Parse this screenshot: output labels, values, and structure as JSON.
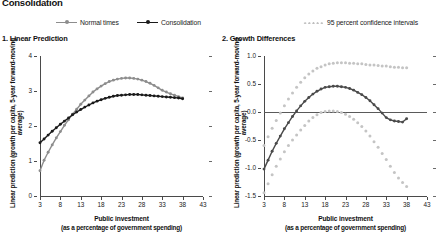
{
  "figure": {
    "title": "Consolidation"
  },
  "legend": {
    "items": [
      {
        "label": "Normal times",
        "style": "line-marker",
        "color": "#8d8d8d"
      },
      {
        "label": "Consolidation",
        "style": "line-marker",
        "color": "#1a1a1a"
      },
      {
        "label": "95 percent confidence intervals",
        "style": "dotted",
        "color": "#bdbdbd"
      }
    ]
  },
  "chart_data": [
    {
      "type": "line",
      "panel_id": 1,
      "title": "1. Linear Prediction",
      "xlabel": "Public investment",
      "xlabel_sub": "(as a percentage of government spending)",
      "ylabel": "Linear prediction (growth per capita, 5-year forward-moving average)",
      "xlim": [
        3,
        43
      ],
      "ylim": [
        0,
        4
      ],
      "xticks": [
        3,
        8,
        13,
        18,
        23,
        28,
        33,
        38,
        43
      ],
      "yticks": [
        0,
        1,
        2,
        3,
        4
      ],
      "grid": false,
      "legend_position": "top",
      "series": [
        {
          "name": "Normal times",
          "color": "#8d8d8d",
          "x": [
            3,
            4,
            5,
            6,
            7,
            8,
            9,
            10,
            11,
            12,
            13,
            14,
            15,
            16,
            17,
            18,
            19,
            20,
            21,
            22,
            23,
            24,
            25,
            26,
            27,
            28,
            29,
            30,
            31,
            32,
            33,
            34,
            35,
            36,
            37,
            38
          ],
          "values": [
            0.72,
            1.02,
            1.25,
            1.46,
            1.66,
            1.84,
            2.02,
            2.18,
            2.34,
            2.48,
            2.62,
            2.74,
            2.86,
            2.97,
            3.06,
            3.14,
            3.21,
            3.27,
            3.31,
            3.34,
            3.36,
            3.37,
            3.37,
            3.36,
            3.34,
            3.31,
            3.27,
            3.22,
            3.16,
            3.09,
            3.02,
            2.97,
            2.92,
            2.88,
            2.84,
            2.8
          ]
        },
        {
          "name": "Consolidation",
          "color": "#1a1a1a",
          "x": [
            3,
            4,
            5,
            6,
            7,
            8,
            9,
            10,
            11,
            12,
            13,
            14,
            15,
            16,
            17,
            18,
            19,
            20,
            21,
            22,
            23,
            24,
            25,
            26,
            27,
            28,
            29,
            30,
            31,
            32,
            33,
            34,
            35,
            36,
            37,
            38
          ],
          "values": [
            1.52,
            1.63,
            1.74,
            1.85,
            1.95,
            2.05,
            2.14,
            2.23,
            2.32,
            2.4,
            2.47,
            2.54,
            2.6,
            2.66,
            2.71,
            2.75,
            2.79,
            2.82,
            2.85,
            2.87,
            2.88,
            2.89,
            2.9,
            2.9,
            2.9,
            2.89,
            2.88,
            2.87,
            2.86,
            2.85,
            2.84,
            2.83,
            2.82,
            2.81,
            2.8,
            2.78
          ]
        }
      ]
    },
    {
      "type": "line",
      "panel_id": 2,
      "title": "2. Growth Differences",
      "xlabel": "Public investment",
      "xlabel_sub": "(as a percentage of government spending)",
      "ylabel": "Linear prediction (growth per capita, 5-year forward-moving average)",
      "xlim": [
        3,
        43
      ],
      "ylim": [
        -1.5,
        1.0
      ],
      "xticks": [
        3,
        8,
        13,
        18,
        23,
        28,
        33,
        38,
        43
      ],
      "yticks": [
        1.0,
        0.5,
        0.0,
        -0.5,
        -1.0,
        -1.5
      ],
      "ytick_labels": [
        "1.0",
        "0.5",
        "0.0",
        "-0.5",
        "-1.0",
        "-1.5"
      ],
      "grid": false,
      "zero_reference_line": 0.0,
      "legend_position": "top",
      "series": [
        {
          "name": "Growth difference",
          "color": "#4a4a4a",
          "x": [
            3,
            4,
            5,
            6,
            7,
            8,
            9,
            10,
            11,
            12,
            13,
            14,
            15,
            16,
            17,
            18,
            19,
            20,
            21,
            22,
            23,
            24,
            25,
            26,
            27,
            28,
            29,
            30,
            31,
            32,
            33,
            34,
            35,
            36,
            37,
            38
          ],
          "values": [
            -1.02,
            -0.86,
            -0.7,
            -0.56,
            -0.43,
            -0.3,
            -0.19,
            -0.08,
            0.02,
            0.11,
            0.19,
            0.26,
            0.32,
            0.37,
            0.41,
            0.44,
            0.45,
            0.46,
            0.46,
            0.45,
            0.44,
            0.42,
            0.39,
            0.35,
            0.31,
            0.26,
            0.2,
            0.13,
            0.06,
            -0.02,
            -0.1,
            -0.14,
            -0.16,
            -0.17,
            -0.18,
            -0.12
          ]
        },
        {
          "name": "Upper 95% confidence interval",
          "color": "#c4c4c4",
          "x": [
            3,
            4,
            5,
            6,
            7,
            8,
            9,
            10,
            11,
            12,
            13,
            14,
            15,
            16,
            17,
            18,
            19,
            20,
            21,
            22,
            23,
            24,
            25,
            26,
            27,
            28,
            29,
            30,
            31,
            32,
            33,
            34,
            35,
            36,
            37,
            38
          ],
          "values": [
            -0.6,
            -0.44,
            -0.29,
            -0.15,
            -0.02,
            0.11,
            0.23,
            0.34,
            0.44,
            0.53,
            0.61,
            0.68,
            0.73,
            0.78,
            0.81,
            0.84,
            0.86,
            0.87,
            0.88,
            0.88,
            0.88,
            0.87,
            0.87,
            0.86,
            0.86,
            0.85,
            0.84,
            0.84,
            0.83,
            0.82,
            0.82,
            0.81,
            0.8,
            0.8,
            0.79,
            0.79
          ]
        },
        {
          "name": "Lower 95% confidence interval",
          "color": "#c4c4c4",
          "x": [
            3,
            4,
            5,
            6,
            7,
            8,
            9,
            10,
            11,
            12,
            13,
            14,
            15,
            16,
            17,
            18,
            19,
            20,
            21,
            22,
            23,
            24,
            25,
            26,
            27,
            28,
            29,
            30,
            31,
            32,
            33,
            34,
            35,
            36,
            37,
            38
          ],
          "values": [
            -1.44,
            -1.28,
            -1.12,
            -0.97,
            -0.84,
            -0.71,
            -0.6,
            -0.5,
            -0.41,
            -0.32,
            -0.24,
            -0.16,
            -0.1,
            -0.05,
            -0.01,
            0.01,
            0.02,
            0.02,
            0.01,
            -0.01,
            -0.04,
            -0.08,
            -0.13,
            -0.19,
            -0.26,
            -0.34,
            -0.43,
            -0.53,
            -0.63,
            -0.74,
            -0.85,
            -0.97,
            -1.08,
            -1.18,
            -1.26,
            -1.33
          ]
        }
      ]
    }
  ]
}
